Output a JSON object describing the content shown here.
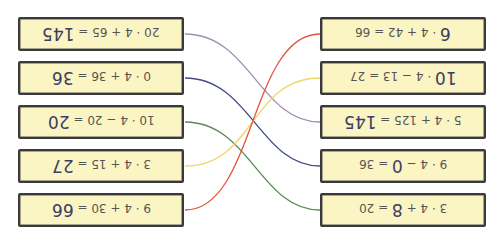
{
  "exercise": {
    "orientation": "rotated-180",
    "left_boxes": [
      {
        "prefix": "20 · 4 + 65 = ",
        "answer": "145",
        "suffix": ""
      },
      {
        "prefix": "0 · 4 + 36 = ",
        "answer": "36",
        "suffix": ""
      },
      {
        "prefix": "10 · 4 − 20 = ",
        "answer": "20",
        "suffix": ""
      },
      {
        "prefix": "3 · 4 + 15 = ",
        "answer": "27",
        "suffix": ""
      },
      {
        "prefix": "9 · 4 + 30 = ",
        "answer": "66",
        "suffix": ""
      }
    ],
    "right_boxes": [
      {
        "prefix": "",
        "answer": "6",
        "suffix": " · 4 + 42 = 66"
      },
      {
        "prefix": "",
        "answer": "10",
        "suffix": " · 4 − 13 = 27"
      },
      {
        "prefix": "5 · 4 + 125 = ",
        "answer": "145",
        "suffix": ""
      },
      {
        "prefix": "9 · 4 − ",
        "answer": "0",
        "suffix": " = 36"
      },
      {
        "prefix": "3 · 4 + ",
        "answer": "8",
        "suffix": " = 20"
      }
    ],
    "connections": [
      {
        "from_left": 1,
        "to_right": 3,
        "color": "#a08fb0"
      },
      {
        "from_left": 2,
        "to_right": 4,
        "color": "#3f4d86"
      },
      {
        "from_left": 3,
        "to_right": 5,
        "color": "#5c8a55"
      },
      {
        "from_left": 4,
        "to_right": 2,
        "color": "#f0d66a"
      },
      {
        "from_left": 5,
        "to_right": 1,
        "color": "#e2543f"
      }
    ]
  }
}
